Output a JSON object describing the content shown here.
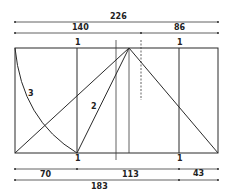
{
  "diagram": {
    "title": "",
    "dimensions_top": {
      "overall": {
        "label": "226",
        "x1": 15,
        "x2": 218,
        "y": 22
      },
      "segments": [
        {
          "label": "140",
          "x1": 15,
          "x2": 141,
          "y": 33
        },
        {
          "label": "86",
          "x1": 141,
          "x2": 218,
          "y": 33
        }
      ]
    },
    "dimensions_bottom": {
      "segments": [
        {
          "label": "70",
          "x1": 15,
          "x2": 77,
          "y": 169
        },
        {
          "label": "113",
          "x1": 77,
          "x2": 179,
          "y": 169
        },
        {
          "label": "43",
          "x1": 179,
          "x2": 218,
          "y": 169
        }
      ],
      "overall": [
        {
          "label": "183",
          "x1": 15,
          "x2": 179,
          "y": 179
        },
        {
          "label": "",
          "x1": 179,
          "x2": 218,
          "y": 179
        }
      ]
    },
    "rectangle": {
      "x": 15,
      "y": 48,
      "width": 203,
      "height": 105
    },
    "apex": {
      "x": 129,
      "y": 48
    },
    "verticals": [
      {
        "name": "unit-line-left",
        "x": 77,
        "y1": 48,
        "y2": 153,
        "label_top": "1",
        "label_bottom": "1"
      },
      {
        "name": "axis-line",
        "x": 116,
        "y1": 40,
        "y2": 160
      },
      {
        "name": "apex-line",
        "x": 129,
        "y1": 48,
        "y2": 153
      },
      {
        "name": "dashed-line",
        "x": 141,
        "y1": 40,
        "y2": 100,
        "dashed": true
      },
      {
        "name": "unit-line-right",
        "x": 179,
        "y1": 48,
        "y2": 153,
        "label_top": "1",
        "label_bottom": "1"
      }
    ],
    "diagonals": [
      {
        "name": "diagonal-long-left",
        "x1": 15,
        "y1": 153,
        "x2": 129,
        "y2": 48
      },
      {
        "name": "diagonal-2",
        "x1": 77,
        "y1": 153,
        "x2": 129,
        "y2": 48,
        "label": "2"
      },
      {
        "name": "diagonal-right",
        "x1": 129,
        "y1": 48,
        "x2": 218,
        "y2": 153
      }
    ],
    "arc": {
      "name": "arc-3",
      "label": "3",
      "from": {
        "x": 15,
        "y": 48
      },
      "to": {
        "x": 77,
        "y": 153
      }
    },
    "labels": {
      "top_left_unit": "1",
      "top_right_unit": "1",
      "bottom_left_unit": "1",
      "bottom_right_unit": "1",
      "arc_label": "3",
      "diagonal_label": "2",
      "dim_226": "226",
      "dim_140": "140",
      "dim_86": "86",
      "dim_70": "70",
      "dim_113": "113",
      "dim_43": "43",
      "dim_183": "183"
    },
    "colors": {
      "stroke": "#2a2a2a",
      "background": "#ffffff"
    }
  }
}
